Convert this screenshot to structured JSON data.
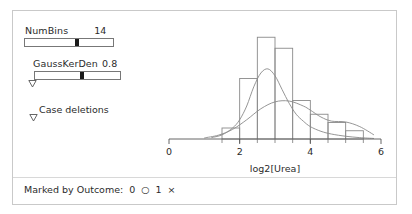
{
  "controls": {
    "numbins": {
      "label": "NumBins",
      "value": "14",
      "thumb_percent": 60
    },
    "gausskerden": {
      "label": "GaussKerDen",
      "value": "0.8",
      "thumb_percent": 55,
      "disclosure_icon": "triangle-down-icon"
    },
    "case_deletions": {
      "label": "Case deletions",
      "disclosure_icon": "triangle-down-icon"
    }
  },
  "footer": {
    "label": "Marked by Outcome:",
    "legend": [
      {
        "value": "0",
        "symbol": "○",
        "symbol_name": "circle-marker"
      },
      {
        "value": "1",
        "symbol": "×",
        "symbol_name": "cross-marker"
      }
    ]
  },
  "chart_data": {
    "type": "bar",
    "title": "",
    "xlabel": "log2[Urea]",
    "ylabel": "",
    "xlim": [
      0,
      6
    ],
    "ylim": [
      0,
      40
    ],
    "grid": false,
    "legend": "none",
    "x_ticks_major": [
      0,
      2,
      4,
      6
    ],
    "x_tick_labels": [
      "0",
      "2",
      "4",
      "6"
    ],
    "x_ticks_minor": [
      1.5,
      2.0,
      2.5,
      3.0,
      3.5,
      4.0,
      4.5,
      5.0,
      5.5
    ],
    "bin_edges": [
      1.5,
      2.0,
      2.5,
      3.0,
      3.5,
      4.0,
      4.5,
      5.0,
      5.5
    ],
    "categories": [
      "1.5-2.0",
      "2.0-2.5",
      "2.5-3.0",
      "3.0-3.5",
      "3.5-4.0",
      "4.0-4.5",
      "4.5-5.0",
      "5.0-5.5"
    ],
    "values": [
      4,
      22,
      37,
      33,
      14,
      9,
      6,
      3
    ],
    "series": [
      {
        "name": "Gaussian kernel density",
        "type": "line",
        "x": [
          1.2,
          1.5,
          1.8,
          2.0,
          2.2,
          2.4,
          2.6,
          2.8,
          3.0,
          3.2,
          3.4,
          3.6,
          3.8,
          4.0,
          4.3,
          4.6,
          5.0,
          5.4,
          5.8
        ],
        "y": [
          0.5,
          1.5,
          4,
          7,
          12,
          19,
          24,
          25.5,
          23,
          18,
          13,
          9,
          6.5,
          4.5,
          2.8,
          1.8,
          1.0,
          0.5,
          0.2
        ]
      },
      {
        "name": "Smoothed density",
        "type": "line",
        "x": [
          1.0,
          1.4,
          1.8,
          2.2,
          2.6,
          3.0,
          3.4,
          3.8,
          4.0,
          4.3,
          4.6,
          5.0,
          5.4,
          5.8
        ],
        "y": [
          0.4,
          1.4,
          3.5,
          7,
          11,
          13.5,
          13.8,
          12,
          10.5,
          8,
          6.5,
          6.2,
          4.5,
          1.5
        ]
      }
    ]
  }
}
